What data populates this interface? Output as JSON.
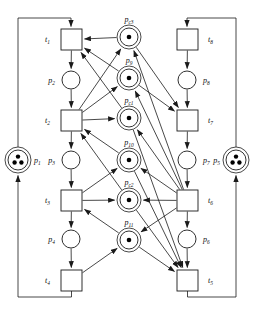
{
  "diagram": {
    "type": "petri-net",
    "width": 254,
    "height": 312,
    "stroke_color": "#1a1a1a",
    "fill_color": "#ffffff",
    "token_color": "#000000"
  },
  "places": [
    {
      "id": "p1",
      "label": "p",
      "sub": "1",
      "cx": 18,
      "cy": 160,
      "r": 10,
      "tokens": 3,
      "double": true,
      "label_x": 34,
      "label_y": 163,
      "label_anchor": "start"
    },
    {
      "id": "p2",
      "label": "p",
      "sub": "2",
      "cx": 71,
      "cy": 80,
      "r": 9,
      "tokens": 0,
      "double": false,
      "label_x": 55,
      "label_y": 83,
      "label_anchor": "end"
    },
    {
      "id": "p3",
      "label": "p",
      "sub": "3",
      "cx": 71,
      "cy": 160,
      "r": 9,
      "tokens": 0,
      "double": false,
      "label_x": 55,
      "label_y": 163,
      "label_anchor": "end"
    },
    {
      "id": "p4",
      "label": "p",
      "sub": "4",
      "cx": 71,
      "cy": 239,
      "r": 9,
      "tokens": 0,
      "double": false,
      "label_x": 55,
      "label_y": 242,
      "label_anchor": "end"
    },
    {
      "id": "p5",
      "label": "p",
      "sub": "5",
      "cx": 236,
      "cy": 160,
      "r": 10,
      "tokens": 3,
      "double": true,
      "label_x": 220,
      "label_y": 163,
      "label_anchor": "end"
    },
    {
      "id": "p6",
      "label": "p",
      "sub": "6",
      "cx": 187,
      "cy": 239,
      "r": 9,
      "tokens": 0,
      "double": false,
      "label_x": 203,
      "label_y": 242,
      "label_anchor": "start"
    },
    {
      "id": "p7",
      "label": "p",
      "sub": "7",
      "cx": 187,
      "cy": 160,
      "r": 9,
      "tokens": 0,
      "double": false,
      "label_x": 203,
      "label_y": 163,
      "label_anchor": "start"
    },
    {
      "id": "p8",
      "label": "p",
      "sub": "8",
      "cx": 187,
      "cy": 80,
      "r": 9,
      "tokens": 0,
      "double": false,
      "label_x": 203,
      "label_y": 83,
      "label_anchor": "start"
    },
    {
      "id": "pc3",
      "label": "p",
      "sub": "c3",
      "cx": 129,
      "cy": 37,
      "r": 9,
      "tokens": 1,
      "double": true,
      "label_x": 129,
      "label_y": 22,
      "label_anchor": "middle"
    },
    {
      "id": "p9",
      "label": "p",
      "sub": "9",
      "cx": 129,
      "cy": 78,
      "r": 9,
      "tokens": 1,
      "double": true,
      "label_x": 129,
      "label_y": 63,
      "label_anchor": "middle"
    },
    {
      "id": "pc1",
      "label": "p",
      "sub": "c1",
      "cx": 129,
      "cy": 118,
      "r": 9,
      "tokens": 1,
      "double": true,
      "label_x": 129,
      "label_y": 103,
      "label_anchor": "middle"
    },
    {
      "id": "p10",
      "label": "p",
      "sub": "10",
      "cx": 129,
      "cy": 160,
      "r": 9,
      "tokens": 1,
      "double": true,
      "label_x": 129,
      "label_y": 145,
      "label_anchor": "middle"
    },
    {
      "id": "pc2",
      "label": "p",
      "sub": "c2",
      "cx": 129,
      "cy": 200,
      "r": 9,
      "tokens": 1,
      "double": true,
      "label_x": 129,
      "label_y": 185,
      "label_anchor": "middle"
    },
    {
      "id": "p11",
      "label": "p",
      "sub": "11",
      "cx": 129,
      "cy": 240,
      "r": 9,
      "tokens": 1,
      "double": true,
      "label_x": 129,
      "label_y": 225,
      "label_anchor": "middle"
    }
  ],
  "transitions": [
    {
      "id": "t1",
      "label": "t",
      "sub": "1",
      "x": 61,
      "y": 29,
      "w": 21,
      "h": 21,
      "label_x": 50,
      "label_y": 42,
      "label_anchor": "end"
    },
    {
      "id": "t2",
      "label": "t",
      "sub": "2",
      "x": 61,
      "y": 110,
      "w": 21,
      "h": 21,
      "label_x": 50,
      "label_y": 123,
      "label_anchor": "end"
    },
    {
      "id": "t3",
      "label": "t",
      "sub": "3",
      "x": 61,
      "y": 190,
      "w": 21,
      "h": 21,
      "label_x": 50,
      "label_y": 203,
      "label_anchor": "end"
    },
    {
      "id": "t4",
      "label": "t",
      "sub": "4",
      "x": 61,
      "y": 270,
      "w": 21,
      "h": 21,
      "label_x": 50,
      "label_y": 283,
      "label_anchor": "end"
    },
    {
      "id": "t5",
      "label": "t",
      "sub": "5",
      "x": 177,
      "y": 270,
      "w": 21,
      "h": 21,
      "label_x": 208,
      "label_y": 283,
      "label_anchor": "start"
    },
    {
      "id": "t6",
      "label": "t",
      "sub": "6",
      "x": 177,
      "y": 190,
      "w": 21,
      "h": 21,
      "label_x": 208,
      "label_y": 203,
      "label_anchor": "start"
    },
    {
      "id": "t7",
      "label": "t",
      "sub": "7",
      "x": 177,
      "y": 110,
      "w": 21,
      "h": 21,
      "label_x": 208,
      "label_y": 123,
      "label_anchor": "start"
    },
    {
      "id": "t8",
      "label": "t",
      "sub": "8",
      "x": 177,
      "y": 29,
      "w": 21,
      "h": 21,
      "label_x": 208,
      "label_y": 42,
      "label_anchor": "start"
    }
  ],
  "arcs": [
    {
      "from": "p1",
      "to": "t1",
      "kind": "outer-left-up"
    },
    {
      "from": "t1",
      "to": "p2",
      "kind": "straight"
    },
    {
      "from": "p2",
      "to": "t2",
      "kind": "straight"
    },
    {
      "from": "t2",
      "to": "p3",
      "kind": "straight"
    },
    {
      "from": "p3",
      "to": "t3",
      "kind": "straight"
    },
    {
      "from": "t3",
      "to": "p4",
      "kind": "straight"
    },
    {
      "from": "p4",
      "to": "t4",
      "kind": "straight"
    },
    {
      "from": "t4",
      "to": "p1",
      "kind": "outer-left-down"
    },
    {
      "from": "p5",
      "to": "t8",
      "kind": "outer-right-up"
    },
    {
      "from": "t8",
      "to": "p8",
      "kind": "straight"
    },
    {
      "from": "p8",
      "to": "t7",
      "kind": "straight"
    },
    {
      "from": "t7",
      "to": "p7",
      "kind": "straight"
    },
    {
      "from": "p7",
      "to": "t6",
      "kind": "straight"
    },
    {
      "from": "t6",
      "to": "p6",
      "kind": "straight"
    },
    {
      "from": "p6",
      "to": "t5",
      "kind": "straight"
    },
    {
      "from": "t5",
      "to": "p5",
      "kind": "outer-right-down"
    },
    {
      "from": "pc3",
      "to": "t1",
      "kind": "diag"
    },
    {
      "from": "t2",
      "to": "pc3",
      "kind": "diag"
    },
    {
      "from": "t6",
      "to": "pc3",
      "kind": "diag"
    },
    {
      "from": "pc3",
      "to": "t7",
      "kind": "diag"
    },
    {
      "from": "t2",
      "to": "p9",
      "kind": "diag"
    },
    {
      "from": "p9",
      "to": "t1",
      "kind": "diag"
    },
    {
      "from": "t6",
      "to": "p9",
      "kind": "diag"
    },
    {
      "from": "p9",
      "to": "t7",
      "kind": "diag"
    },
    {
      "from": "t2",
      "to": "pc1",
      "kind": "straight"
    },
    {
      "from": "pc1",
      "to": "t1",
      "kind": "diag"
    },
    {
      "from": "t6",
      "to": "pc1",
      "kind": "diag"
    },
    {
      "from": "pc1",
      "to": "t5",
      "kind": "diag"
    },
    {
      "from": "t3",
      "to": "p10",
      "kind": "diag"
    },
    {
      "from": "p10",
      "to": "t2",
      "kind": "diag"
    },
    {
      "from": "t6",
      "to": "p10",
      "kind": "diag"
    },
    {
      "from": "p10",
      "to": "t5",
      "kind": "diag"
    },
    {
      "from": "t3",
      "to": "pc2",
      "kind": "straight"
    },
    {
      "from": "pc2",
      "to": "t2",
      "kind": "diag"
    },
    {
      "from": "t6",
      "to": "pc2",
      "kind": "straight"
    },
    {
      "from": "pc2",
      "to": "t5",
      "kind": "diag"
    },
    {
      "from": "t4",
      "to": "p11",
      "kind": "diag"
    },
    {
      "from": "p11",
      "to": "t3",
      "kind": "diag"
    },
    {
      "from": "t6",
      "to": "p11",
      "kind": "diag"
    },
    {
      "from": "p11",
      "to": "t5",
      "kind": "diag"
    }
  ]
}
